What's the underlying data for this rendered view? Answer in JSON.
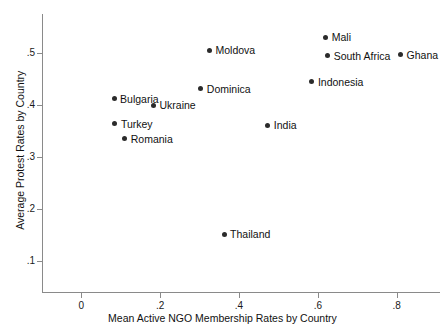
{
  "chart_data": {
    "type": "scatter",
    "title": "",
    "xlabel": "Mean Active NGO Membership Rates by Country",
    "ylabel": "Average Protest Rates by Country",
    "xlim": [
      -0.1,
      0.91
    ],
    "ylim": [
      0.04,
      0.575
    ],
    "grid": false,
    "legend": "none",
    "xticks": [
      0,
      0.2,
      0.4,
      0.6,
      0.8
    ],
    "xtick_labels": [
      "0",
      ".2",
      ".4",
      ".6",
      ".8"
    ],
    "yticks": [
      0.1,
      0.2,
      0.3,
      0.4,
      0.5
    ],
    "ytick_labels": [
      ".1",
      ".2",
      ".3",
      ".4",
      ".5"
    ],
    "points": [
      {
        "label": "Mali",
        "x": 0.62,
        "y": 0.53
      },
      {
        "label": "Moldova",
        "x": 0.325,
        "y": 0.505
      },
      {
        "label": "South Africa",
        "x": 0.625,
        "y": 0.495
      },
      {
        "label": "Ghana",
        "x": 0.81,
        "y": 0.497
      },
      {
        "label": "Indonesia",
        "x": 0.585,
        "y": 0.445
      },
      {
        "label": "Dominica",
        "x": 0.303,
        "y": 0.431
      },
      {
        "label": "Bulgaria",
        "x": 0.083,
        "y": 0.412
      },
      {
        "label": "Ukraine",
        "x": 0.183,
        "y": 0.399
      },
      {
        "label": "Turkey",
        "x": 0.085,
        "y": 0.364
      },
      {
        "label": "India",
        "x": 0.473,
        "y": 0.361
      },
      {
        "label": "Romania",
        "x": 0.11,
        "y": 0.335
      },
      {
        "label": "Thailand",
        "x": 0.362,
        "y": 0.151
      }
    ]
  },
  "colors": {
    "marker": "#2b2b2b",
    "axis": "#8a8a8a",
    "text": "#111111",
    "background": "#ffffff"
  }
}
